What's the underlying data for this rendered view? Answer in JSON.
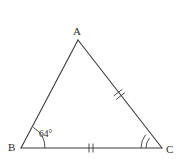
{
  "figure": {
    "type": "geometry-diagram",
    "shape": "triangle",
    "background_color": "#ffffff",
    "stroke_color": "#3a3a3a",
    "text_color": "#2b2b2b",
    "vertices": [
      {
        "name": "A",
        "label": "A",
        "x": 78,
        "y": 40
      },
      {
        "name": "B",
        "label": "B",
        "x": 21,
        "y": 148
      },
      {
        "name": "C",
        "label": "C",
        "x": 162,
        "y": 148
      }
    ],
    "sides": [
      {
        "name": "AB",
        "from": "A",
        "to": "B",
        "tick_marks": 0
      },
      {
        "name": "AC",
        "from": "A",
        "to": "C",
        "tick_marks": 2
      },
      {
        "name": "BC",
        "from": "B",
        "to": "C",
        "tick_marks": 2
      }
    ],
    "angles": [
      {
        "at": "B",
        "label": "64°",
        "arcs": 1
      },
      {
        "at": "C",
        "label": "",
        "arcs": 2
      }
    ]
  }
}
